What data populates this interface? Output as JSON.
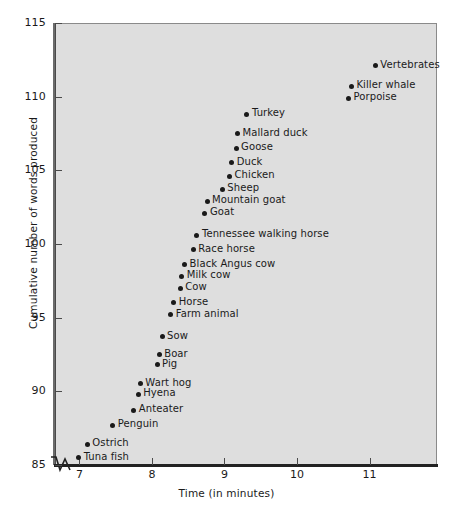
{
  "chart_data": {
    "type": "scatter",
    "title": "",
    "xlabel": "Time (in minutes)",
    "ylabel": "Cumulative number of words produced",
    "xlim": [
      6.65,
      11.93
    ],
    "ylim": [
      85,
      115
    ],
    "xticks": [
      7,
      8,
      9,
      10,
      11
    ],
    "yticks": [
      85,
      90,
      95,
      100,
      105,
      110,
      115
    ],
    "grid": false,
    "legend": null,
    "axis_break": true,
    "background_color": "#dedede",
    "point_color": "#1a1a1a",
    "points": [
      {
        "label": "Tuna fish",
        "x": 6.99,
        "y": 85.5
      },
      {
        "label": "Ostrich",
        "x": 7.11,
        "y": 86.4
      },
      {
        "label": "Penguin",
        "x": 7.46,
        "y": 87.7
      },
      {
        "label": "Anteater",
        "x": 7.75,
        "y": 88.7
      },
      {
        "label": "Hyena",
        "x": 7.81,
        "y": 89.8
      },
      {
        "label": "Wart hog",
        "x": 7.84,
        "y": 90.5
      },
      {
        "label": "Pig",
        "x": 8.07,
        "y": 91.8
      },
      {
        "label": "Boar",
        "x": 8.1,
        "y": 92.5
      },
      {
        "label": "Sow",
        "x": 8.14,
        "y": 93.7
      },
      {
        "label": "Farm animal",
        "x": 8.26,
        "y": 95.2
      },
      {
        "label": "Horse",
        "x": 8.3,
        "y": 96.0
      },
      {
        "label": "Cow",
        "x": 8.39,
        "y": 97.0
      },
      {
        "label": "Milk cow",
        "x": 8.41,
        "y": 97.8
      },
      {
        "label": "Black Angus cow",
        "x": 8.45,
        "y": 98.6
      },
      {
        "label": "Race horse",
        "x": 8.57,
        "y": 99.6
      },
      {
        "label": "Tennessee walking horse",
        "x": 8.62,
        "y": 100.6
      },
      {
        "label": "Goat",
        "x": 8.73,
        "y": 102.1
      },
      {
        "label": "Mountain goat",
        "x": 8.76,
        "y": 102.9
      },
      {
        "label": "Sheep",
        "x": 8.97,
        "y": 103.7
      },
      {
        "label": "Chicken",
        "x": 9.07,
        "y": 104.6
      },
      {
        "label": "Duck",
        "x": 9.1,
        "y": 105.5
      },
      {
        "label": "Goose",
        "x": 9.16,
        "y": 106.5
      },
      {
        "label": "Mallard duck",
        "x": 9.18,
        "y": 107.5
      },
      {
        "label": "Turkey",
        "x": 9.31,
        "y": 108.8
      },
      {
        "label": "Porpoise",
        "x": 10.71,
        "y": 109.9
      },
      {
        "label": "Killer whale",
        "x": 10.75,
        "y": 110.7
      },
      {
        "label": "Vertebrates",
        "x": 11.08,
        "y": 112.1
      }
    ]
  }
}
